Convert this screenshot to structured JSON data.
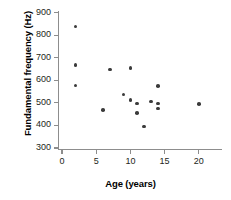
{
  "chart_data": {
    "type": "scatter",
    "title": "",
    "xlabel": "Age (years)",
    "ylabel": "Fundamental frequency (Hz)",
    "xlim": [
      -1,
      23
    ],
    "ylim": [
      265,
      920
    ],
    "xticks": [
      0,
      5,
      10,
      15,
      20
    ],
    "yticks": [
      300,
      400,
      500,
      600,
      700,
      800,
      900
    ],
    "xtick_labels": [
      "0",
      "5",
      "10",
      "15",
      "20"
    ],
    "ytick_labels": [
      "300",
      "400",
      "500",
      "600",
      "700",
      "800",
      "900"
    ],
    "grid": false,
    "legend": null,
    "series": [
      {
        "name": "observations",
        "marker": "circle",
        "color": "#3b3b3b",
        "points": [
          {
            "x": 2,
            "y": 838
          },
          {
            "x": 2,
            "y": 667
          },
          {
            "x": 2,
            "y": 578
          },
          {
            "x": 6,
            "y": 469
          },
          {
            "x": 7,
            "y": 648
          },
          {
            "x": 9,
            "y": 537
          },
          {
            "x": 10,
            "y": 654
          },
          {
            "x": 10,
            "y": 514
          },
          {
            "x": 11,
            "y": 497
          },
          {
            "x": 11,
            "y": 456
          },
          {
            "x": 12,
            "y": 395
          },
          {
            "x": 13,
            "y": 506
          },
          {
            "x": 14,
            "y": 575
          },
          {
            "x": 14,
            "y": 497
          },
          {
            "x": 14,
            "y": 475
          },
          {
            "x": 20,
            "y": 496
          }
        ]
      }
    ]
  },
  "axis_labels": {
    "x": "Age (years)",
    "y": "Fundamental frequency (Hz)"
  },
  "colors": {
    "marker": "#3b3b3b",
    "axis": "#8d8d8d",
    "text": "#231f20",
    "background": "#ffffff"
  }
}
